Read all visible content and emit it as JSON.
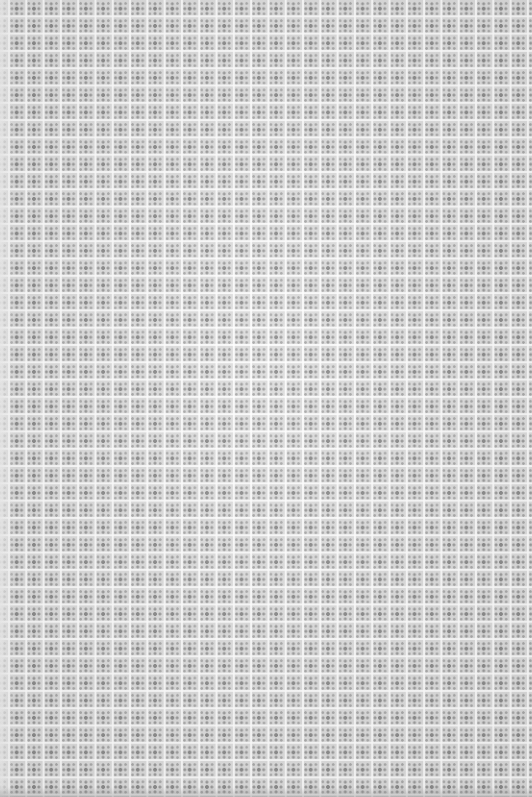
{
  "image": {
    "description": "Scanned sheet of gray patterned paper with a repeating grid of small square tiles, each containing a floral/cross motif",
    "colors": {
      "background": "#dcdcdc",
      "grid_lines": "#f5f5f5",
      "motif": "#8a8a8a"
    },
    "pattern": {
      "tile_size_px": 17,
      "columns": 31,
      "rows": 46
    }
  }
}
